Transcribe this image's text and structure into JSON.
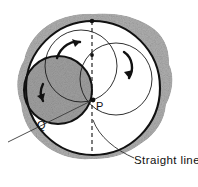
{
  "figure": {
    "background_color": "#ffffff",
    "ink_color": "#111111",
    "blob_fill": "#b3b3b3",
    "inner_disc_fill": "#9d9d9d",
    "white_fill": "#ffffff"
  },
  "labels": {
    "point_p": "P",
    "point_q": "Q",
    "straight_line": "Straight line"
  },
  "geometry": {
    "big_circle": {
      "cx": 93,
      "cy": 88,
      "r": 68,
      "stroke_width": 2.0
    },
    "top_circle": {
      "cx": 81,
      "cy": 66,
      "r": 36,
      "stroke_width": 1.0
    },
    "right_circle": {
      "cx": 116,
      "cy": 78,
      "r": 36,
      "stroke_width": 1.0
    },
    "shaded_circle": {
      "cx": 58,
      "cy": 90,
      "r": 34,
      "stroke_width": 2.0
    },
    "dashed_line": {
      "x": 92,
      "y1": 21,
      "y2": 156,
      "dash": "4 3"
    },
    "diagonal_line": {
      "x1": 10,
      "y1": 141,
      "x2": 93,
      "y2": 100
    },
    "point_p_dot": {
      "cx": 93,
      "cy": 100,
      "r": 2.2
    },
    "point_top_dot": {
      "cx": 92,
      "cy": 21,
      "r": 2.2
    },
    "point_mid_dot": {
      "cx": 92,
      "cy": 55,
      "r": 2.0
    }
  },
  "arrows": [
    {
      "name": "top-rotation-arrow",
      "direction": "clockwise-up-right"
    },
    {
      "name": "right-rotation-arrow",
      "direction": "clockwise-down"
    },
    {
      "name": "left-rotation-arrow",
      "direction": "counterclockwise-down-left"
    }
  ],
  "leader": {
    "name": "straight-line-leader",
    "from_x": 93,
    "from_y": 120,
    "to_x": 150,
    "to_y": 158
  },
  "text_positions": {
    "point_p": {
      "x": 96,
      "y": 109
    },
    "point_q": {
      "x": 38,
      "y": 128
    },
    "straight_line": {
      "x": 133,
      "y": 163
    }
  }
}
